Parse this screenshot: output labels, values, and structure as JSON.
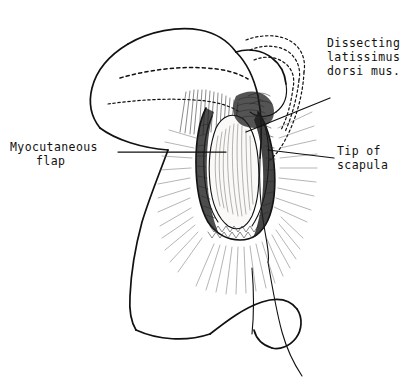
{
  "figure": {
    "medium": "pen-and-ink medical illustration",
    "background_color": "#ffffff",
    "ink_color": "#111111",
    "view": "lateral torso, patient lying on side, surgeon's hand retracting flap"
  },
  "labels": {
    "dissecting": {
      "line1": "Dissecting",
      "line2": "latissimus",
      "line3": "dorsi mus.",
      "position": "top-right",
      "leader": "diagonal down-left to muscle edge"
    },
    "myocutaneous": {
      "line1": "Myocutaneous",
      "line2": "flap",
      "position": "left",
      "leader": "horizontal right to flap body"
    },
    "tip_of_scapula": {
      "line1": "Tip of",
      "line2": "scapula",
      "position": "right",
      "leader": "horizontal left to scapula tip"
    }
  },
  "structures": [
    {
      "name": "torso-outline",
      "kind": "body contour"
    },
    {
      "name": "hand-fingers",
      "kind": "surgeon hand retracting"
    },
    {
      "name": "scapula-dashed-outline",
      "kind": "subcutaneous bone, dashed"
    },
    {
      "name": "flap-body",
      "kind": "elevated myocutaneous flap"
    },
    {
      "name": "muscle-hatching",
      "kind": "latissimus dorsi fibers"
    },
    {
      "name": "wound-bed-hatching",
      "kind": "radiating fascia lines"
    },
    {
      "name": "hip-contour",
      "kind": "iliac crest / flank"
    }
  ]
}
